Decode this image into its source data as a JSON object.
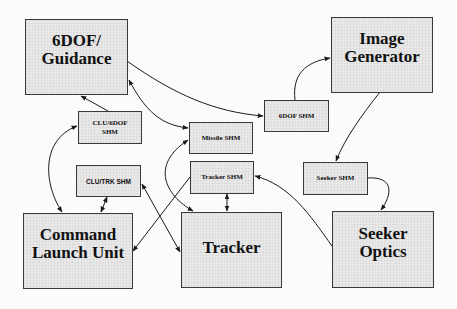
{
  "diagram": {
    "nodes": [
      {
        "id": "guidance",
        "label": "6DOF/\nGuidance",
        "kind": "component"
      },
      {
        "id": "image_generator",
        "label": "Image\nGenerator",
        "kind": "component"
      },
      {
        "id": "clu_6dof_shm",
        "label": "CLU/6DOF\nSHM",
        "kind": "shared-memory"
      },
      {
        "id": "missile_shm",
        "label": "Missile SHM",
        "kind": "shared-memory"
      },
      {
        "id": "dof_shm",
        "label": "6DOF SHM",
        "kind": "shared-memory"
      },
      {
        "id": "clu_trk_shm",
        "label": "CLU/TRK SHM",
        "kind": "shared-memory"
      },
      {
        "id": "tracker_shm",
        "label": "Tracker SHM",
        "kind": "shared-memory"
      },
      {
        "id": "seeker_shm",
        "label": "Seeker SHM",
        "kind": "shared-memory"
      },
      {
        "id": "clu",
        "label": "Command\nLaunch Unit",
        "kind": "component"
      },
      {
        "id": "tracker",
        "label": "Tracker",
        "kind": "component"
      },
      {
        "id": "seeker_optics",
        "label": "Seeker\nOptics",
        "kind": "component"
      }
    ],
    "edges": [
      {
        "from": "guidance",
        "to": "dof_shm",
        "direction": "one-way"
      },
      {
        "from": "dof_shm",
        "to": "image_generator",
        "direction": "one-way"
      },
      {
        "from": "image_generator",
        "to": "seeker_shm",
        "direction": "one-way"
      },
      {
        "from": "seeker_shm",
        "to": "seeker_optics",
        "direction": "one-way"
      },
      {
        "from": "seeker_optics",
        "to": "tracker_shm",
        "direction": "one-way"
      },
      {
        "from": "clu_6dof_shm",
        "to": "guidance",
        "direction": "one-way"
      },
      {
        "from": "guidance",
        "to": "missile_shm",
        "direction": "two-way"
      },
      {
        "from": "clu",
        "to": "clu_6dof_shm",
        "direction": "two-way"
      },
      {
        "from": "clu_trk_shm",
        "to": "clu",
        "direction": "two-way"
      },
      {
        "from": "clu_trk_shm",
        "to": "tracker",
        "direction": "two-way"
      },
      {
        "from": "missile_shm",
        "to": "tracker",
        "direction": "two-way"
      },
      {
        "from": "tracker_shm",
        "to": "tracker",
        "direction": "two-way"
      },
      {
        "from": "tracker_shm",
        "to": "clu",
        "direction": "one-way"
      }
    ]
  },
  "colors": {
    "box_fill": "#e9e9e9",
    "box_border": "#3a3a3a",
    "arrow": "#1a1a1a",
    "background": "#fbfbfb"
  }
}
